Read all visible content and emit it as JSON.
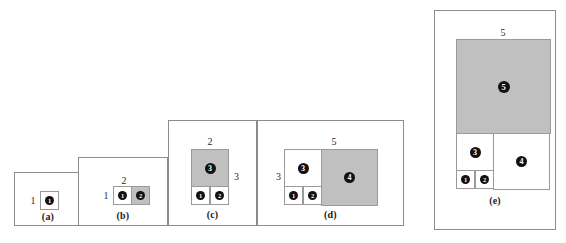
{
  "figure": {
    "shade_color": "#c0c0c0",
    "line_color": "#8c8c8c",
    "badge_color": "#111111"
  },
  "panels": [
    {
      "caption": "(a)",
      "dims": {
        "left": "1"
      },
      "squares": [
        {
          "label": "1",
          "shaded": false
        }
      ]
    },
    {
      "caption": "(b)",
      "dims": {
        "left": "1",
        "top": "2"
      },
      "squares": [
        {
          "label": "1",
          "shaded": false
        },
        {
          "label": "2",
          "shaded": true
        }
      ]
    },
    {
      "caption": "(c)",
      "dims": {
        "top": "2",
        "right": "3"
      },
      "squares": [
        {
          "label": "1",
          "shaded": false
        },
        {
          "label": "2",
          "shaded": false
        },
        {
          "label": "3",
          "shaded": true
        }
      ]
    },
    {
      "caption": "(d)",
      "dims": {
        "left": "3",
        "top": "5"
      },
      "squares": [
        {
          "label": "1",
          "shaded": false
        },
        {
          "label": "2",
          "shaded": false
        },
        {
          "label": "3",
          "shaded": false
        },
        {
          "label": "4",
          "shaded": true
        }
      ]
    },
    {
      "caption": "(e)",
      "dims": {
        "top": "5",
        "right": "8"
      },
      "squares": [
        {
          "label": "1",
          "shaded": false
        },
        {
          "label": "2",
          "shaded": false
        },
        {
          "label": "3",
          "shaded": false
        },
        {
          "label": "4",
          "shaded": false
        },
        {
          "label": "5",
          "shaded": true
        }
      ]
    }
  ]
}
